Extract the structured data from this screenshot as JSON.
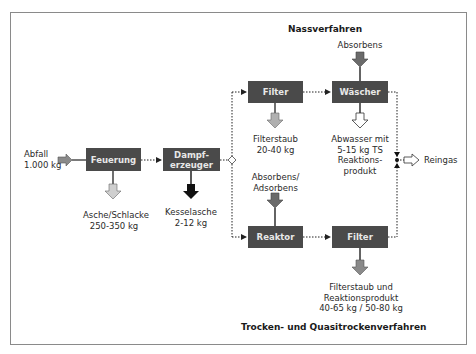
{
  "titles": {
    "wet": "Nassverfahren",
    "dry": "Trocken- und Quasitrockenverfahren"
  },
  "boxes": {
    "feuerung": "Feuerung",
    "dampferzeuger_line1": "Dampf-",
    "dampferzeuger_line2": "erzeuger",
    "filter_top": "Filter",
    "waescher": "Wäscher",
    "reaktor": "Reaktor",
    "filter_bottom": "Filter"
  },
  "labels": {
    "abfall_line1": "Abfall",
    "abfall_line2": "1.000 kg",
    "asche_line1": "Asche/Schlacke",
    "asche_line2": "250-350 kg",
    "kesselasche_line1": "Kesselasche",
    "kesselasche_line2": "2-12 kg",
    "absorbens_top": "Absorbens",
    "filterstaub_line1": "Filterstaub",
    "filterstaub_line2": "20-40 kg",
    "abwasser_line1": "Abwasser mit",
    "abwasser_line2": "5-15 kg TS",
    "abwasser_line3": "Reaktions-",
    "abwasser_line4": "produkt",
    "reingas": "Reingas",
    "absorbens_adsorbens_line1": "Absorbens/",
    "absorbens_adsorbens_line2": "Adsorbens",
    "filterstaub2_line1": "Filterstaub und",
    "filterstaub2_line2": "Reaktionsprodukt",
    "filterstaub2_line3": "40-65 kg / 50-80 kg"
  },
  "colors": {
    "box_fill": "#4a4a4a",
    "box_text": "#e8e8e8",
    "arrow_grey": "#8a8a8a",
    "arrow_light": "#cfcfcf",
    "arrow_black": "#111111",
    "frame": "#8a8a8a"
  }
}
